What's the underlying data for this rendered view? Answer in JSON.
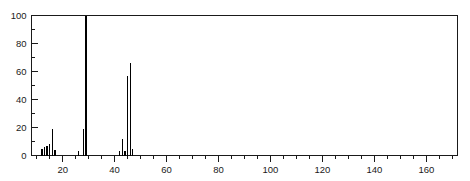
{
  "chart_data": {
    "type": "bar",
    "title": "",
    "subtitle": "",
    "xlabel": "",
    "ylabel": "",
    "xlim": [
      8,
      172
    ],
    "ylim": [
      0,
      100
    ],
    "grid": false,
    "legend": null,
    "x_tick_labels": [
      "20",
      "40",
      "60",
      "80",
      "100",
      "120",
      "140",
      "160"
    ],
    "x_tick_values": [
      20,
      40,
      60,
      80,
      100,
      120,
      140,
      160
    ],
    "x_minor_tick_step": 5,
    "y_tick_labels": [
      "0",
      "20",
      "40",
      "60",
      "80",
      "100"
    ],
    "y_tick_values": [
      0,
      20,
      40,
      60,
      80,
      100
    ],
    "y_minor_tick_step": 10,
    "x": [
      12,
      13,
      14,
      15,
      16,
      17,
      26,
      28,
      29,
      42,
      43,
      44,
      45,
      46,
      47
    ],
    "values": [
      5,
      6,
      7,
      8,
      19,
      4,
      3,
      19,
      100,
      3,
      12,
      3,
      57,
      66,
      5
    ],
    "series": [
      {
        "name": "intensity",
        "values": [
          5,
          6,
          7,
          8,
          19,
          4,
          3,
          19,
          100,
          3,
          12,
          3,
          57,
          66,
          5
        ]
      }
    ],
    "base_peak_mz": 29,
    "base_peak_intensity": 100
  }
}
